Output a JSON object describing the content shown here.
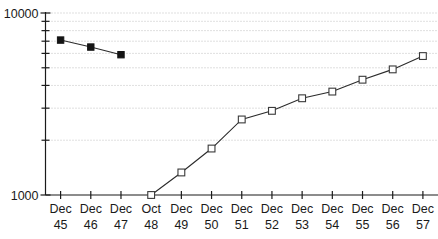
{
  "chart_data": {
    "type": "line",
    "title": "",
    "xlabel": "",
    "ylabel": "",
    "yscale": "log",
    "ylim": [
      1000,
      10000
    ],
    "grid": true,
    "legend": "none",
    "y_tick_labels": [
      "10000",
      "1000"
    ],
    "y_gridline_values": [
      9000,
      8000,
      7000,
      6000,
      5000,
      4000,
      3000,
      2000
    ],
    "categories": [
      "Dec 45",
      "Dec 46",
      "Dec 47",
      "Oct 48",
      "Dec 49",
      "Dec 50",
      "Dec 51",
      "Dec 52",
      "Dec 53",
      "Dec 54",
      "Dec 55",
      "Dec 56",
      "Dec 57"
    ],
    "category_lines": [
      [
        "Dec",
        "45"
      ],
      [
        "Dec",
        "46"
      ],
      [
        "Dec",
        "47"
      ],
      [
        "Oct",
        "48"
      ],
      [
        "Dec",
        "49"
      ],
      [
        "Dec",
        "50"
      ],
      [
        "Dec",
        "51"
      ],
      [
        "Dec",
        "52"
      ],
      [
        "Dec",
        "53"
      ],
      [
        "Dec",
        "54"
      ],
      [
        "Dec",
        "55"
      ],
      [
        "Dec",
        "56"
      ],
      [
        "Dec",
        "57"
      ]
    ],
    "series": [
      {
        "name": "series-filled",
        "marker": "filled-square",
        "points": [
          {
            "x": "Dec 45",
            "y": 7100
          },
          {
            "x": "Dec 46",
            "y": 6500
          },
          {
            "x": "Dec 47",
            "y": 5900
          }
        ]
      },
      {
        "name": "series-open",
        "marker": "open-square",
        "points": [
          {
            "x": "Oct 48",
            "y": 1000
          },
          {
            "x": "Dec 49",
            "y": 1330
          },
          {
            "x": "Dec 50",
            "y": 1800
          },
          {
            "x": "Dec 51",
            "y": 2600
          },
          {
            "x": "Dec 52",
            "y": 2900
          },
          {
            "x": "Dec 53",
            "y": 3400
          },
          {
            "x": "Dec 54",
            "y": 3700
          },
          {
            "x": "Dec 55",
            "y": 4300
          },
          {
            "x": "Dec 56",
            "y": 4900
          },
          {
            "x": "Dec 57",
            "y": 5800
          }
        ]
      }
    ],
    "colors": {
      "axis": "#1a1a1a",
      "grid": "#b9b9b9",
      "line": "#2b2b2b",
      "marker_fill": "#141414",
      "marker_open_fill": "#ffffff",
      "background": "#ffffff"
    }
  }
}
